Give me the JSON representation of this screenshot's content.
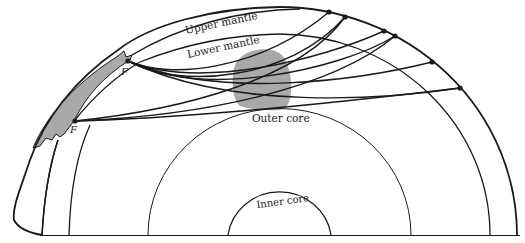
{
  "diagram": {
    "type": "earth-cross-section-seismic-rays",
    "labels": {
      "upper_mantle": "Upper mantle",
      "lower_mantle": "Lower mantle",
      "outer_core": "Outer core",
      "inner_core": "Inner core",
      "focus_upper": "F",
      "focus_lower": "F"
    },
    "colors": {
      "line": "#1a1a1a",
      "fill_anomaly": "#a9a9a9",
      "background": "#ffffff"
    },
    "layers": [
      {
        "name": "surface",
        "rx": 238,
        "ry": 228
      },
      {
        "name": "upper-lower-mantle-boundary",
        "rx": 211,
        "ry": 201
      },
      {
        "name": "core-mantle-boundary",
        "rx": 131,
        "ry": 126
      },
      {
        "name": "inner-core-boundary",
        "rx": 52,
        "ry": 50
      }
    ],
    "receivers": [
      {
        "x": 329,
        "y": 12
      },
      {
        "x": 345,
        "y": 17
      },
      {
        "x": 384,
        "y": 31
      },
      {
        "x": 395,
        "y": 36
      },
      {
        "x": 432,
        "y": 62
      },
      {
        "x": 460,
        "y": 88
      }
    ]
  }
}
